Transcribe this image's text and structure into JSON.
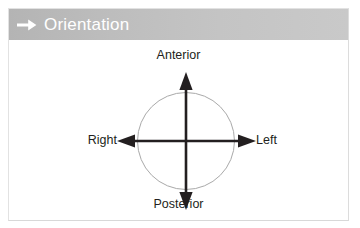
{
  "figure": {
    "header": {
      "icon": "arrow-right-icon",
      "title": "Orientation",
      "background_color": "#bdbdbd",
      "text_color": "#ffffff"
    },
    "diagram": {
      "type": "anatomical-orientation-axes",
      "circle": {
        "stroke_color": "#a9a9a9",
        "fill": "none"
      },
      "axis_color": "#231f20",
      "labels": {
        "top": "Anterior",
        "bottom": "Posterior",
        "left": "Right",
        "right": "Left"
      }
    },
    "border_color": "#e2e2e2",
    "background_color": "#ffffff"
  }
}
